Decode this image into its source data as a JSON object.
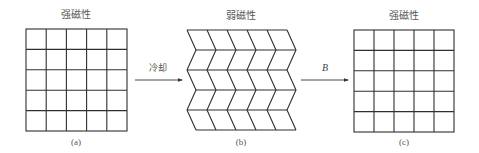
{
  "panels": [
    {
      "id": "a",
      "title": "强磁性",
      "caption": "(a)",
      "type": "square-grid",
      "rows": 5,
      "cols": 5
    },
    {
      "id": "b",
      "title": "弱磁性",
      "caption": "(b)",
      "type": "zigzag-grid",
      "rows": 5,
      "cols": 5
    },
    {
      "id": "c",
      "title": "强磁性",
      "caption": "(c)",
      "type": "square-grid",
      "rows": 5,
      "cols": 5
    }
  ],
  "arrows": [
    {
      "from": "a",
      "to": "b",
      "label": "冷却"
    },
    {
      "from": "b",
      "to": "c",
      "label": "B"
    }
  ],
  "colors": {
    "line": "#2f2f2f",
    "text": "#555555"
  }
}
